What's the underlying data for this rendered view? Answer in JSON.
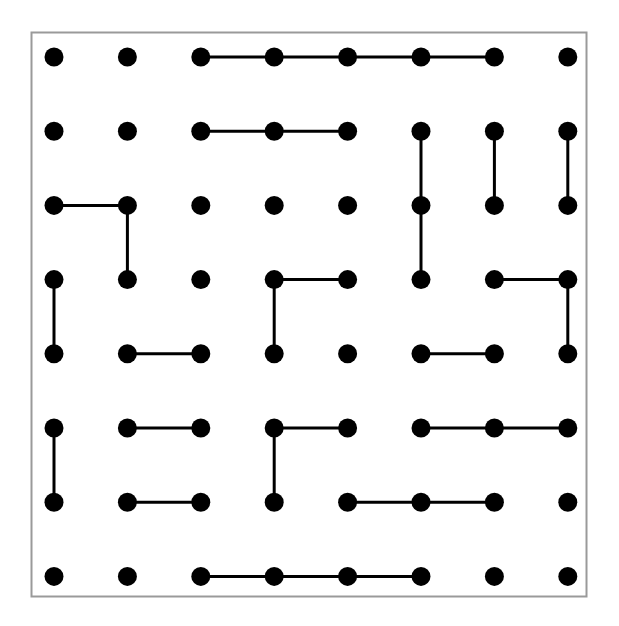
{
  "diagram": {
    "type": "dot-grid-puzzle",
    "rows": 8,
    "cols": 8,
    "colors": {
      "dot": "#000000",
      "line": "#000000",
      "border": "#9a9a9a",
      "background": "#ffffff"
    },
    "segments": [
      [
        [
          0,
          2
        ],
        [
          0,
          3
        ]
      ],
      [
        [
          0,
          3
        ],
        [
          0,
          4
        ]
      ],
      [
        [
          0,
          4
        ],
        [
          0,
          5
        ]
      ],
      [
        [
          0,
          5
        ],
        [
          0,
          6
        ]
      ],
      [
        [
          1,
          2
        ],
        [
          1,
          3
        ]
      ],
      [
        [
          1,
          3
        ],
        [
          1,
          4
        ]
      ],
      [
        [
          1,
          5
        ],
        [
          2,
          5
        ]
      ],
      [
        [
          2,
          5
        ],
        [
          3,
          5
        ]
      ],
      [
        [
          1,
          6
        ],
        [
          2,
          6
        ]
      ],
      [
        [
          1,
          7
        ],
        [
          2,
          7
        ]
      ],
      [
        [
          2,
          0
        ],
        [
          2,
          1
        ]
      ],
      [
        [
          2,
          1
        ],
        [
          3,
          1
        ]
      ],
      [
        [
          3,
          0
        ],
        [
          4,
          0
        ]
      ],
      [
        [
          3,
          3
        ],
        [
          3,
          4
        ]
      ],
      [
        [
          3,
          3
        ],
        [
          4,
          3
        ]
      ],
      [
        [
          3,
          6
        ],
        [
          3,
          7
        ]
      ],
      [
        [
          3,
          7
        ],
        [
          4,
          7
        ]
      ],
      [
        [
          4,
          1
        ],
        [
          4,
          2
        ]
      ],
      [
        [
          4,
          5
        ],
        [
          4,
          6
        ]
      ],
      [
        [
          5,
          0
        ],
        [
          6,
          0
        ]
      ],
      [
        [
          5,
          1
        ],
        [
          5,
          2
        ]
      ],
      [
        [
          5,
          3
        ],
        [
          5,
          4
        ]
      ],
      [
        [
          5,
          3
        ],
        [
          6,
          3
        ]
      ],
      [
        [
          5,
          5
        ],
        [
          5,
          6
        ]
      ],
      [
        [
          5,
          6
        ],
        [
          5,
          7
        ]
      ],
      [
        [
          6,
          1
        ],
        [
          6,
          2
        ]
      ],
      [
        [
          6,
          4
        ],
        [
          6,
          5
        ]
      ],
      [
        [
          6,
          5
        ],
        [
          6,
          6
        ]
      ],
      [
        [
          7,
          2
        ],
        [
          7,
          3
        ]
      ],
      [
        [
          7,
          3
        ],
        [
          7,
          4
        ]
      ],
      [
        [
          7,
          4
        ],
        [
          7,
          5
        ]
      ]
    ]
  }
}
